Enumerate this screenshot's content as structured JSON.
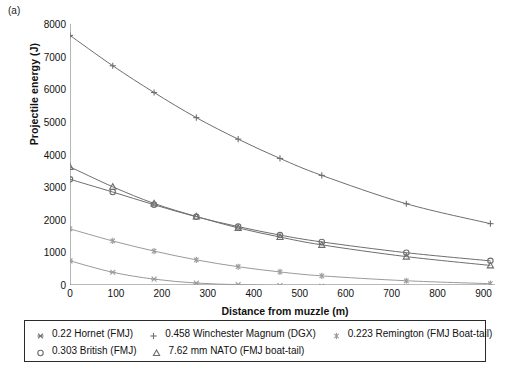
{
  "panel": {
    "label": "(a)"
  },
  "axes": {
    "ylabel": "Projectile energy (J)",
    "xlabel": "Distance from muzzle (m)",
    "yticks": [
      "0",
      "1000",
      "2000",
      "3000",
      "4000",
      "5000",
      "6000",
      "7000",
      "8000"
    ],
    "xticks": [
      "0",
      "100",
      "200",
      "300",
      "400",
      "500",
      "600",
      "700",
      "800",
      "900"
    ]
  },
  "legend": {
    "rows": [
      [
        {
          "marker": "asterisk-x",
          "label": "0.22 Hornet (FMJ)",
          "color": "#6e6e6e"
        },
        {
          "marker": "plus",
          "label": "0.458 Winchester Magnum (DGX)",
          "color": "#6e6e6e"
        },
        {
          "marker": "star",
          "label": "0.223 Remington (FMJ Boat-tail)",
          "color": "#9a9a9a"
        }
      ],
      [
        {
          "marker": "circle",
          "label": "0.303 British (FMJ)",
          "color": "#6e6e6e"
        },
        {
          "marker": "triangle",
          "label": "7.62 mm NATO (FMJ boat-tail)",
          "color": "#6e6e6e"
        }
      ]
    ]
  },
  "chart_data": {
    "type": "line",
    "title": "",
    "xlabel": "Distance from muzzle (m)",
    "ylabel": "Projectile energy (J)",
    "xlim": [
      0,
      925
    ],
    "ylim": [
      0,
      8000
    ],
    "grid": false,
    "legend_position": "below",
    "x": [
      0,
      93,
      183,
      275,
      366,
      457,
      548,
      732,
      915
    ],
    "series": [
      {
        "name": "0.458 Winchester Magnum (DGX)",
        "marker": "plus",
        "color": "#6e6e6e",
        "values": [
          7650,
          6720,
          5900,
          5130,
          4470,
          3880,
          3360,
          2490,
          1880
        ]
      },
      {
        "name": "7.62 mm NATO (FMJ boat-tail)",
        "marker": "triangle",
        "color": "#6e6e6e",
        "values": [
          3620,
          3010,
          2500,
          2100,
          1750,
          1470,
          1230,
          870,
          600
        ]
      },
      {
        "name": "0.303 British (FMJ)",
        "marker": "circle",
        "color": "#6e6e6e",
        "values": [
          3240,
          2850,
          2460,
          2090,
          1790,
          1530,
          1320,
          990,
          740
        ]
      },
      {
        "name": "0.223 Remington (FMJ Boat-tail)",
        "marker": "star",
        "color": "#9a9a9a",
        "values": [
          1720,
          1350,
          1040,
          770,
          560,
          400,
          280,
          130,
          40
        ]
      },
      {
        "name": "0.22 Hornet (FMJ)",
        "marker": "asterisk-x",
        "color": "#9a9a9a",
        "values": [
          740,
          390,
          180,
          60,
          10,
          -20,
          -40,
          -60,
          -80
        ]
      }
    ]
  }
}
